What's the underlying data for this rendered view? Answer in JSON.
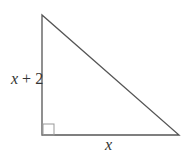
{
  "diagram": {
    "type": "right-triangle",
    "vertices": {
      "top": [
        42,
        15
      ],
      "bottom_left": [
        42,
        135
      ],
      "bottom_right": [
        179,
        135
      ]
    },
    "right_angle_at": "bottom_left",
    "labels": {
      "vertical_side_var": "x",
      "vertical_side_rest": " + 2",
      "horizontal_side": "x"
    },
    "colors": {
      "stroke": "#555555",
      "right_angle_marker": "#999999"
    }
  }
}
